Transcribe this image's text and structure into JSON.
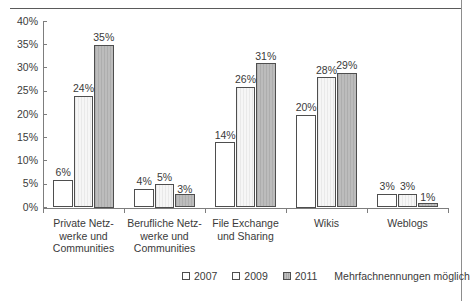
{
  "figure": {
    "ghost_title": "Abbildung: Nutzung von Social Software im Unternehmen",
    "note": "Mehrfachnennungen möglich"
  },
  "legend": {
    "position": "bottom-right",
    "entries": [
      {
        "label": "2007",
        "swatch": "white-square-icon"
      },
      {
        "label": "2009",
        "swatch": "light-square-icon"
      },
      {
        "label": "2011",
        "swatch": "gray-square-icon"
      }
    ]
  },
  "chart_data": {
    "type": "bar",
    "title": "",
    "xlabel": "",
    "ylabel": "",
    "ylim": [
      0,
      40
    ],
    "ytick_labels": [
      "0%",
      "5%",
      "10%",
      "15%",
      "20%",
      "25%",
      "30%",
      "35%",
      "40%"
    ],
    "ytick_values": [
      0,
      5,
      10,
      15,
      20,
      25,
      30,
      35,
      40
    ],
    "grid": false,
    "legend_position": "bottom-right",
    "annotations": [
      "Mehrfachnennungen möglich"
    ],
    "categories": [
      "Private Netz-\nwerke und\nCommunities",
      "Berufliche Netz-\nwerke und\nCommunities",
      "File Exchange\nund Sharing",
      "Wikis",
      "Weblogs"
    ],
    "series": [
      {
        "name": "2007",
        "values": [
          6,
          4,
          14,
          20,
          3
        ],
        "labels": [
          "6%",
          "4%",
          "14%",
          "20%",
          "3%"
        ]
      },
      {
        "name": "2009",
        "values": [
          24,
          5,
          26,
          28,
          3
        ],
        "labels": [
          "24%",
          "5%",
          "26%",
          "28%",
          "3%"
        ]
      },
      {
        "name": "2011",
        "values": [
          35,
          3,
          31,
          29,
          1
        ],
        "labels": [
          "35%",
          "3%",
          "31%",
          "29%",
          "1%"
        ]
      }
    ]
  }
}
